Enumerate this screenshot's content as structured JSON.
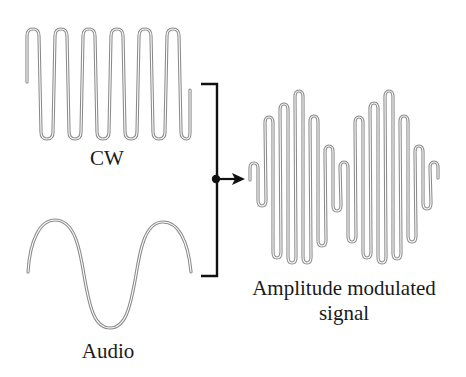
{
  "diagram": {
    "colors": {
      "wave": "#8a8a8a",
      "line": "#111111",
      "text": "#1a1a1a",
      "background": "#ffffff"
    },
    "nodes": [
      {
        "id": "cw",
        "label": "CW",
        "kind": "carrier-wave",
        "cycles": 6
      },
      {
        "id": "audio",
        "label": "Audio",
        "kind": "audio-sine",
        "cycles": 1
      },
      {
        "id": "am",
        "label_line1": "Amplitude modulated",
        "label_line2": "signal",
        "kind": "modulated-signal",
        "envelope_lobes": 2
      }
    ],
    "edges": [
      {
        "from": [
          "cw",
          "audio"
        ],
        "to": "am",
        "style": "bracket-join-arrow"
      }
    ]
  },
  "labels": {
    "cw": "CW",
    "audio": "Audio",
    "am_line1": "Amplitude modulated",
    "am_line2": "signal"
  }
}
